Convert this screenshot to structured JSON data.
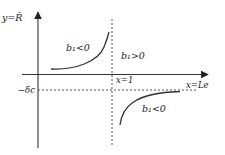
{
  "diagram": {
    "y_axis_label": "y=R̄",
    "x_axis_label": "x=Le",
    "vertical_asymptote_label": "x=1",
    "horizontal_asymptote_label": "−δc",
    "regions": [
      {
        "label": "b₁<0",
        "position": "upper-left"
      },
      {
        "label": "b₁>0",
        "position": "upper-right"
      },
      {
        "label": "b₁<0",
        "position": "lower-right"
      }
    ],
    "colors": {
      "line": "#333333",
      "background": "#ffffff"
    }
  }
}
